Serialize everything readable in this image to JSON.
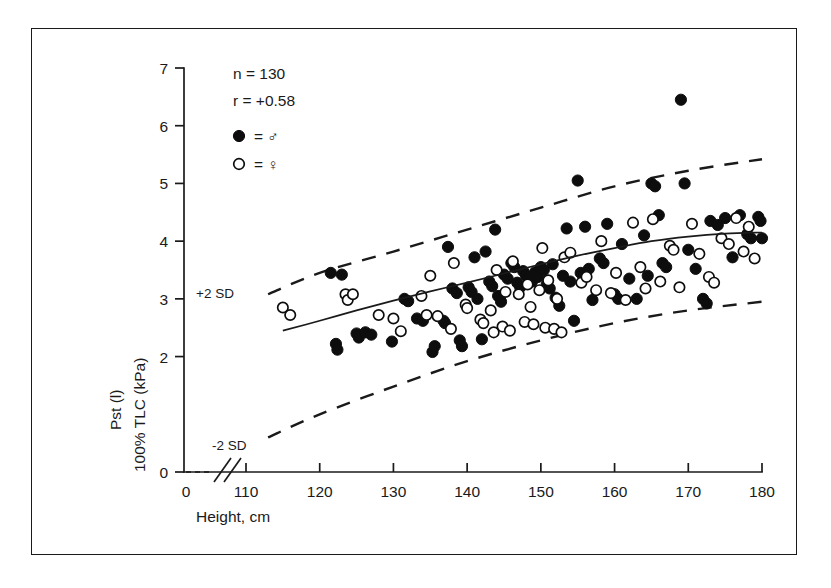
{
  "figure": {
    "frame_color": "#1a1a1a",
    "background": "#ffffff"
  },
  "annotations": {
    "n_label": "n = 130",
    "r_label": "r = +0.58",
    "legend_male": "= ♂",
    "legend_female": "= ♀",
    "upper_band_label": "+2 SD",
    "lower_band_label": "-2 SD"
  },
  "axes": {
    "x_title": "Height, cm",
    "y_title_line1": "Pst (l)",
    "y_title_line2": "100% TLC (kPa)",
    "x_ticks": [
      "0",
      "110",
      "120",
      "130",
      "140",
      "150",
      "160",
      "170",
      "180"
    ],
    "y_ticks": [
      "0",
      "2",
      "3",
      "4",
      "5",
      "6",
      "7"
    ],
    "x_break_present": true,
    "y_break_present": true
  },
  "chart_data": {
    "type": "scatter",
    "title": "",
    "xlabel": "Height, cm",
    "ylabel": "Pst (l) 100% TLC (kPa)",
    "xlim": [
      110,
      180
    ],
    "ylim": [
      0,
      7
    ],
    "x_ticks": [
      110,
      120,
      130,
      140,
      150,
      160,
      170,
      180
    ],
    "y_ticks": [
      0,
      2,
      3,
      4,
      5,
      6,
      7
    ],
    "grid": false,
    "legend_position": "top-left",
    "n": 130,
    "r": 0.58,
    "series": [
      {
        "name": "male",
        "marker": "filled-circle",
        "color": "#0d0d0d",
        "points": [
          [
            121.5,
            3.45
          ],
          [
            123.0,
            3.42
          ],
          [
            122.2,
            2.22
          ],
          [
            122.4,
            2.12
          ],
          [
            125.0,
            2.4
          ],
          [
            125.3,
            2.33
          ],
          [
            126.2,
            2.42
          ],
          [
            127.0,
            2.38
          ],
          [
            129.8,
            2.26
          ],
          [
            131.5,
            3.0
          ],
          [
            132.0,
            2.96
          ],
          [
            133.2,
            2.66
          ],
          [
            134.0,
            2.62
          ],
          [
            135.3,
            2.08
          ],
          [
            135.6,
            2.18
          ],
          [
            136.8,
            2.62
          ],
          [
            137.0,
            2.58
          ],
          [
            137.4,
            3.9
          ],
          [
            138.0,
            3.18
          ],
          [
            138.6,
            3.1
          ],
          [
            139.0,
            2.28
          ],
          [
            139.3,
            2.18
          ],
          [
            140.2,
            3.2
          ],
          [
            140.6,
            3.12
          ],
          [
            141.0,
            3.72
          ],
          [
            141.4,
            3.0
          ],
          [
            142.0,
            2.3
          ],
          [
            142.5,
            3.82
          ],
          [
            143.0,
            3.3
          ],
          [
            143.4,
            3.22
          ],
          [
            143.8,
            4.2
          ],
          [
            144.2,
            3.05
          ],
          [
            144.6,
            2.95
          ],
          [
            145.0,
            3.42
          ],
          [
            145.5,
            3.35
          ],
          [
            146.0,
            3.62
          ],
          [
            146.4,
            3.55
          ],
          [
            146.8,
            3.28
          ],
          [
            147.2,
            3.2
          ],
          [
            147.6,
            3.48
          ],
          [
            148.0,
            3.4
          ],
          [
            148.4,
            3.35
          ],
          [
            148.8,
            3.3
          ],
          [
            149.2,
            3.46
          ],
          [
            149.6,
            3.38
          ],
          [
            150.0,
            3.55
          ],
          [
            150.4,
            3.5
          ],
          [
            150.8,
            3.25
          ],
          [
            151.2,
            3.18
          ],
          [
            151.6,
            3.6
          ],
          [
            152.0,
            3.02
          ],
          [
            152.5,
            2.88
          ],
          [
            153.0,
            3.4
          ],
          [
            153.5,
            4.22
          ],
          [
            154.0,
            3.3
          ],
          [
            154.5,
            2.62
          ],
          [
            155.0,
            5.05
          ],
          [
            155.4,
            3.45
          ],
          [
            156.0,
            4.25
          ],
          [
            156.5,
            3.52
          ],
          [
            157.0,
            2.98
          ],
          [
            158.0,
            3.7
          ],
          [
            158.5,
            3.62
          ],
          [
            159.0,
            4.3
          ],
          [
            160.0,
            3.08
          ],
          [
            160.5,
            3.0
          ],
          [
            161.0,
            3.95
          ],
          [
            162.0,
            3.35
          ],
          [
            163.0,
            3.0
          ],
          [
            164.0,
            4.1
          ],
          [
            164.5,
            3.4
          ],
          [
            165.0,
            5.0
          ],
          [
            165.5,
            4.95
          ],
          [
            166.0,
            4.45
          ],
          [
            166.5,
            3.62
          ],
          [
            167.0,
            3.55
          ],
          [
            169.0,
            6.45
          ],
          [
            169.5,
            5.0
          ],
          [
            170.0,
            3.85
          ],
          [
            171.0,
            3.52
          ],
          [
            172.0,
            3.0
          ],
          [
            172.5,
            2.92
          ],
          [
            173.0,
            4.35
          ],
          [
            174.0,
            4.28
          ],
          [
            175.0,
            4.4
          ],
          [
            176.0,
            3.72
          ],
          [
            177.0,
            4.45
          ],
          [
            178.0,
            4.12
          ],
          [
            178.5,
            4.05
          ],
          [
            179.5,
            4.42
          ],
          [
            179.8,
            4.35
          ],
          [
            180.0,
            4.05
          ]
        ]
      },
      {
        "name": "female",
        "marker": "open-circle",
        "color": "#0d0d0d",
        "points": [
          [
            115.0,
            2.85
          ],
          [
            116.0,
            2.72
          ],
          [
            123.5,
            3.08
          ],
          [
            123.8,
            2.98
          ],
          [
            124.5,
            3.08
          ],
          [
            128.0,
            2.72
          ],
          [
            130.0,
            2.66
          ],
          [
            133.8,
            3.05
          ],
          [
            134.5,
            2.72
          ],
          [
            136.0,
            2.7
          ],
          [
            138.2,
            3.62
          ],
          [
            139.8,
            2.9
          ],
          [
            140.0,
            2.84
          ],
          [
            141.8,
            2.64
          ],
          [
            142.2,
            2.58
          ],
          [
            143.2,
            2.8
          ],
          [
            144.0,
            3.5
          ],
          [
            144.8,
            2.52
          ],
          [
            145.2,
            3.12
          ],
          [
            145.8,
            2.45
          ],
          [
            146.2,
            3.65
          ],
          [
            147.0,
            3.08
          ],
          [
            147.8,
            2.6
          ],
          [
            148.2,
            3.25
          ],
          [
            149.0,
            2.56
          ],
          [
            149.8,
            3.15
          ],
          [
            150.2,
            3.88
          ],
          [
            150.6,
            2.5
          ],
          [
            151.0,
            3.32
          ],
          [
            151.8,
            2.48
          ],
          [
            152.2,
            3.0
          ],
          [
            153.2,
            3.72
          ],
          [
            154.0,
            3.8
          ],
          [
            155.5,
            3.28
          ],
          [
            157.5,
            3.15
          ],
          [
            158.2,
            4.0
          ],
          [
            159.5,
            3.1
          ],
          [
            160.2,
            3.45
          ],
          [
            161.5,
            2.98
          ],
          [
            162.5,
            4.32
          ],
          [
            163.5,
            3.55
          ],
          [
            164.2,
            3.18
          ],
          [
            165.2,
            4.38
          ],
          [
            166.2,
            3.3
          ],
          [
            167.5,
            3.92
          ],
          [
            168.0,
            3.85
          ],
          [
            170.5,
            4.3
          ],
          [
            171.5,
            3.78
          ],
          [
            172.8,
            3.38
          ],
          [
            173.5,
            3.28
          ],
          [
            174.5,
            4.05
          ],
          [
            175.5,
            3.95
          ],
          [
            176.5,
            4.4
          ],
          [
            177.5,
            3.82
          ],
          [
            178.2,
            4.25
          ],
          [
            179.0,
            3.7
          ],
          [
            137.8,
            2.48
          ],
          [
            135.0,
            3.4
          ],
          [
            131.0,
            2.44
          ],
          [
            152.8,
            2.42
          ],
          [
            156.2,
            3.38
          ],
          [
            168.8,
            3.2
          ],
          [
            143.6,
            2.42
          ],
          [
            148.6,
            2.86
          ]
        ]
      }
    ],
    "regression_curve": {
      "name": "mean-regression",
      "style": "solid",
      "points": [
        [
          115,
          2.45
        ],
        [
          120,
          2.62
        ],
        [
          125,
          2.8
        ],
        [
          130,
          2.97
        ],
        [
          135,
          3.13
        ],
        [
          140,
          3.28
        ],
        [
          145,
          3.44
        ],
        [
          150,
          3.6
        ],
        [
          155,
          3.75
        ],
        [
          160,
          3.88
        ],
        [
          165,
          4.0
        ],
        [
          170,
          4.08
        ],
        [
          175,
          4.13
        ],
        [
          180,
          4.15
        ]
      ]
    },
    "upper_band": {
      "name": "+2 SD",
      "style": "dashed",
      "points": [
        [
          113,
          3.08
        ],
        [
          120,
          3.45
        ],
        [
          130,
          3.82
        ],
        [
          140,
          4.2
        ],
        [
          150,
          4.58
        ],
        [
          160,
          4.95
        ],
        [
          170,
          5.22
        ],
        [
          180,
          5.42
        ]
      ]
    },
    "lower_band": {
      "name": "-2 SD",
      "style": "dashed",
      "points": [
        [
          113,
          0.6
        ],
        [
          120,
          1.0
        ],
        [
          130,
          1.48
        ],
        [
          140,
          1.92
        ],
        [
          150,
          2.28
        ],
        [
          160,
          2.58
        ],
        [
          170,
          2.8
        ],
        [
          180,
          2.95
        ]
      ]
    }
  }
}
